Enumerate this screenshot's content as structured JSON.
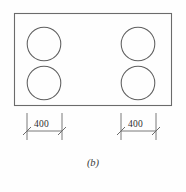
{
  "figure": {
    "caption": "(b)",
    "background_color": "#fefefe",
    "line_color": "#6b6b6b",
    "text_color": "#2e2e2e"
  },
  "diagram": {
    "type": "engineering-plan-view",
    "outline": {
      "shape": "rectangle",
      "x": 14,
      "y": 13,
      "width": 158,
      "height": 93,
      "fill": "none",
      "stroke": "#6b6b6b"
    },
    "circles": [
      {
        "name": "burner-top-left",
        "cx": 44,
        "cy": 44,
        "r": 17
      },
      {
        "name": "burner-bottom-left",
        "cx": 44,
        "cy": 83,
        "r": 17
      },
      {
        "name": "burner-top-right",
        "cx": 138,
        "cy": 44,
        "r": 17
      },
      {
        "name": "burner-bottom-right",
        "cx": 138,
        "cy": 83,
        "r": 17
      }
    ],
    "dimensions": [
      {
        "name": "dimension-left",
        "value": "400",
        "unit": "",
        "x_start": 27,
        "x_end": 62,
        "line_y": 131,
        "ext_top": 113,
        "ext_bottom": 140
      },
      {
        "name": "dimension-right",
        "value": "400",
        "unit": "",
        "x_start": 121,
        "x_end": 156,
        "line_y": 131,
        "ext_top": 113,
        "ext_bottom": 140
      }
    ]
  }
}
